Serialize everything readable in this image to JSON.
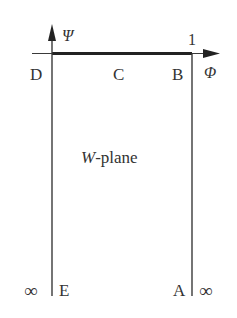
{
  "diagram": {
    "plane_label_var": "W",
    "plane_label_suffix": "-plane",
    "axes": {
      "vertical_label": "Ψ",
      "horizontal_label": "Φ"
    },
    "tick_label": "1",
    "points": {
      "D": "D",
      "C": "C",
      "B": "B",
      "E": "E",
      "A": "A"
    },
    "infinity_left": "∞",
    "infinity_right": "∞",
    "colors": {
      "line": "#3a3a3a",
      "thick_line": "#222222",
      "text": "#333333"
    }
  }
}
